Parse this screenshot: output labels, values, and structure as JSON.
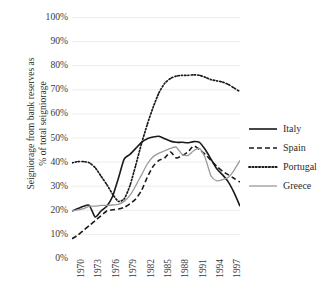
{
  "chart_data": {
    "type": "line",
    "title": "",
    "xlabel": "",
    "ylabel": "Seigniorage from bank reserves as % of total seigniorage",
    "ylabel_line1": "Seigniorage from bank reserves as",
    "ylabel_line2": "% of total seigniorage",
    "ylim": [
      0,
      100
    ],
    "xlim": [
      1970,
      1999
    ],
    "grid": true,
    "grid_axis": "y",
    "legend_position": "right",
    "y_ticks": [
      "0%",
      "10%",
      "20%",
      "30%",
      "40%",
      "50%",
      "60%",
      "70%",
      "80%",
      "90%",
      "100%"
    ],
    "y_tick_values": [
      0,
      10,
      20,
      30,
      40,
      50,
      60,
      70,
      80,
      90,
      100
    ],
    "x_ticks": [
      "1970",
      "1973",
      "1976",
      "1979",
      "1982",
      "1985",
      "1988",
      "1991",
      "1994",
      "1997"
    ],
    "x_tick_values": [
      1970,
      1973,
      1976,
      1979,
      1982,
      1985,
      1988,
      1991,
      1994,
      1997
    ],
    "x": [
      1970,
      1971,
      1972,
      1973,
      1974,
      1975,
      1976,
      1977,
      1978,
      1979,
      1980,
      1981,
      1982,
      1983,
      1984,
      1985,
      1986,
      1987,
      1988,
      1989,
      1990,
      1991,
      1992,
      1993,
      1994,
      1995,
      1996,
      1997,
      1998,
      1999
    ],
    "series": [
      {
        "name": "Italy",
        "color": "#1a1a1a",
        "style": "solid",
        "values": [
          19.5,
          20.5,
          21.5,
          21.8,
          17.0,
          19.5,
          21.5,
          25.5,
          33.0,
          41.0,
          43.0,
          45.5,
          48.0,
          49.5,
          50.2,
          50.5,
          49.5,
          48.5,
          48.0,
          48.0,
          47.8,
          48.3,
          48.0,
          45.0,
          41.0,
          37.0,
          34.5,
          31.5,
          27.0,
          21.5
        ]
      },
      {
        "name": "Spain",
        "color": "#1a1a1a",
        "style": "dashed",
        "values": [
          8.0,
          9.5,
          11.5,
          13.5,
          15.5,
          17.5,
          19.5,
          20.0,
          20.3,
          21.0,
          22.5,
          24.5,
          28.0,
          33.5,
          38.0,
          40.5,
          41.5,
          44.0,
          41.5,
          42.5,
          44.0,
          46.5,
          45.0,
          43.0,
          40.5,
          38.0,
          36.0,
          34.5,
          33.0,
          31.5
        ]
      },
      {
        "name": "Portugal",
        "color": "#1a1a1a",
        "style": "dotted",
        "values": [
          39.5,
          40.0,
          40.0,
          39.5,
          37.5,
          34.0,
          30.5,
          26.5,
          23.5,
          24.5,
          30.0,
          38.5,
          47.5,
          55.5,
          62.5,
          68.5,
          72.5,
          74.5,
          75.5,
          75.8,
          75.8,
          76.0,
          75.8,
          75.0,
          74.0,
          73.5,
          73.0,
          72.0,
          70.5,
          69.0
        ]
      },
      {
        "name": "Greece",
        "color": "#9a9a9a",
        "style": "solid",
        "values": [
          19.5,
          20.0,
          20.5,
          21.5,
          21.5,
          21.8,
          21.8,
          22.0,
          22.3,
          23.5,
          26.0,
          30.0,
          34.5,
          39.0,
          42.0,
          43.5,
          44.5,
          45.5,
          46.0,
          43.0,
          42.5,
          44.5,
          45.5,
          41.5,
          34.0,
          32.0,
          32.5,
          33.5,
          36.5,
          40.5
        ]
      }
    ],
    "annotations": []
  },
  "legend": {
    "items": [
      {
        "label": "Italy",
        "style": "solid",
        "color": "#1a1a1a"
      },
      {
        "label": "Spain",
        "style": "dashed",
        "color": "#1a1a1a"
      },
      {
        "label": "Portugal",
        "style": "dotted",
        "color": "#1a1a1a"
      },
      {
        "label": "Greece",
        "style": "solid",
        "color": "#9a9a9a"
      }
    ]
  },
  "style": {
    "grid_color": "#ececec",
    "axis_text_color": "#3a3a3a",
    "background": "#ffffff"
  }
}
